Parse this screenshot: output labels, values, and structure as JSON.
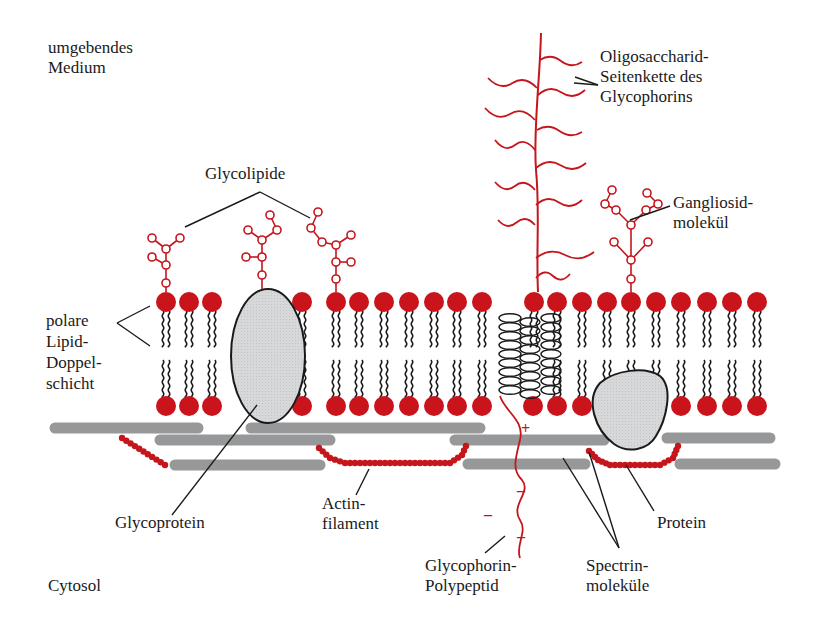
{
  "colors": {
    "red": "#c4161c",
    "head_red": "#c8141a",
    "gray_fill": "#d4d6d8",
    "spectrin_gray": "#8f9091",
    "ink": "#1a1a1a",
    "background": "#ffffff"
  },
  "labels": {
    "outside": {
      "line1": "umgebendes",
      "line2": "Medium"
    },
    "cytosol": "Cytosol",
    "glycolipide": "Glycolipide",
    "oligosaccharid": {
      "line1": "Oligosaccharid-",
      "line2": "Seitenkette des",
      "line3": "Glycophorins"
    },
    "gangliosid": {
      "line1": "Gangliosid-",
      "line2": "molekül"
    },
    "bilayer": {
      "line1": "polare",
      "line2": "Lipid-",
      "line3": "Doppel-",
      "line4": "schicht"
    },
    "glycoprotein": "Glycoprotein",
    "actin": {
      "line1": "Actin-",
      "line2": "filament"
    },
    "glycophorin": {
      "line1": "Glycophorin-",
      "line2": "Polypeptid"
    },
    "spectrin": {
      "line1": "Spectrin-",
      "line2": "moleküle"
    },
    "protein": "Protein",
    "plus_sign": "+",
    "minus_sign": "–"
  },
  "membrane": {
    "top_head_y": 302,
    "bottom_head_y": 406,
    "head_radius": 10,
    "lipid_x": [
      166,
      189,
      212,
      302,
      336,
      359,
      384,
      409,
      434,
      457,
      482,
      534,
      557,
      582,
      607,
      631,
      656,
      681,
      707,
      732,
      757
    ],
    "bottom_only_x": [
      533
    ],
    "omit_bottom_x": [
      534
    ],
    "missing_bottom_near_protein": []
  },
  "glycoprotein": {
    "cx": 268,
    "cy": 356,
    "rx": 37,
    "ry": 67
  },
  "protein": {
    "label": "Protein"
  },
  "spectrin_bars": [
    {
      "x1": 55,
      "y1": 428,
      "x2": 198,
      "y2": 428
    },
    {
      "x1": 251,
      "y1": 428,
      "x2": 480,
      "y2": 428
    },
    {
      "x1": 160,
      "y1": 440,
      "x2": 330,
      "y2": 440
    },
    {
      "x1": 455,
      "y1": 440,
      "x2": 604,
      "y2": 440
    },
    {
      "x1": 667,
      "y1": 438,
      "x2": 770,
      "y2": 438
    },
    {
      "x1": 175,
      "y1": 465,
      "x2": 320,
      "y2": 465
    },
    {
      "x1": 468,
      "y1": 464,
      "x2": 585,
      "y2": 464
    },
    {
      "x1": 680,
      "y1": 464,
      "x2": 775,
      "y2": 464
    }
  ]
}
